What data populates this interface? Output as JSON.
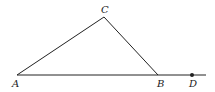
{
  "diagram": {
    "type": "geometry-triangle",
    "points": {
      "A": {
        "label": "A",
        "x": 17,
        "y": 75
      },
      "B": {
        "label": "B",
        "x": 158,
        "y": 75
      },
      "C": {
        "label": "C",
        "x": 104,
        "y": 17
      },
      "D": {
        "label": "D",
        "x": 192,
        "y": 75
      }
    },
    "segments": [
      [
        "A",
        "C"
      ],
      [
        "C",
        "B"
      ],
      [
        "A",
        "D"
      ]
    ],
    "line_end_x": 206,
    "dot_point": "D",
    "colors": {
      "stroke": "#222222",
      "background": "#ffffff"
    }
  }
}
